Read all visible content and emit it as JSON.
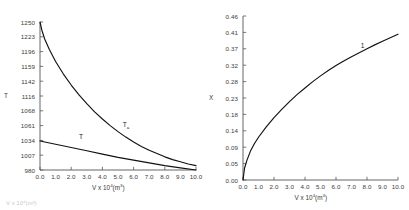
{
  "chart_data": [
    {
      "type": "line",
      "panel": "left",
      "title": "",
      "xlabel": "V x 10⁴(m³)",
      "ylabel": "T",
      "xlim": [
        0.0,
        10.0
      ],
      "ylim": [
        980,
        1250
      ],
      "grid": false,
      "legend": "inline-curve-labels",
      "xticks": [
        "0.0",
        "1.0",
        "2.0",
        "3.0",
        "4.0",
        "5.0",
        "6.0",
        "7.0",
        "8.0",
        "9.0",
        "10.0"
      ],
      "xtick_values": [
        0,
        1,
        2,
        3,
        4,
        5,
        6,
        7,
        8,
        9,
        10
      ],
      "yticks": [
        "980",
        "1007",
        "1034",
        "1061",
        "1068",
        "1116",
        "1142",
        "1159",
        "1196",
        "1223",
        "1250"
      ],
      "ytick_values": [
        980,
        1007,
        1034,
        1061,
        1088,
        1115,
        1142,
        1169,
        1196,
        1223,
        1250
      ],
      "series": [
        {
          "name": "T_a",
          "label_text": "T",
          "label_sub": "a",
          "label_x": 5.3,
          "label_y": 1062,
          "x": [
            0.0,
            0.12,
            0.3,
            0.6,
            1.0,
            1.5,
            2.0,
            2.5,
            3.0,
            3.5,
            4.0,
            4.5,
            5.0,
            5.5,
            6.0,
            6.5,
            7.0,
            7.5,
            8.0,
            8.5,
            9.0,
            9.5,
            10.0
          ],
          "values": [
            1250,
            1235,
            1219,
            1200,
            1178,
            1155,
            1135,
            1117,
            1101,
            1086,
            1073,
            1061,
            1050,
            1040,
            1031,
            1023,
            1016,
            1010,
            1004,
            999,
            995,
            991,
            988
          ]
        },
        {
          "name": "T",
          "label_text": "T",
          "label_sub": "",
          "label_x": 2.5,
          "label_y": 1040,
          "x": [
            0.0,
            1.0,
            2.0,
            3.0,
            4.0,
            5.0,
            6.0,
            7.0,
            8.0,
            9.0,
            10.0
          ],
          "values": [
            1033,
            1027,
            1021,
            1015,
            1009,
            1003,
            998,
            993,
            988,
            984,
            980
          ]
        }
      ]
    },
    {
      "type": "line",
      "panel": "right",
      "title": "",
      "xlabel": "V x 10⁴(m³)",
      "ylabel": "X",
      "xlim": [
        0.0,
        10.0
      ],
      "ylim": [
        0.0,
        0.46
      ],
      "grid": false,
      "legend": "inline-curve-labels",
      "xticks": [
        "0.0",
        "1.0",
        "2.0",
        "3.0",
        "4.0",
        "5.0",
        "6.0",
        "7.0",
        "8.0",
        "9.0",
        "10.0"
      ],
      "xtick_values": [
        0,
        1,
        2,
        3,
        4,
        5,
        6,
        7,
        8,
        9,
        10
      ],
      "yticks": [
        "0.00",
        "0.05",
        "0.09",
        "0.14",
        "0.18",
        "0.23",
        "0.28",
        "0.32",
        "0.37",
        "0.41",
        "0.46"
      ],
      "ytick_values": [
        0.0,
        0.046,
        0.092,
        0.138,
        0.184,
        0.23,
        0.276,
        0.322,
        0.368,
        0.414,
        0.46
      ],
      "series": [
        {
          "name": "1",
          "label_text": "1",
          "label_sub": "",
          "label_x": 7.6,
          "label_y": 0.375,
          "x": [
            0.0,
            0.1,
            0.25,
            0.5,
            0.75,
            1.0,
            1.5,
            2.0,
            2.5,
            3.0,
            3.5,
            4.0,
            4.5,
            5.0,
            5.5,
            6.0,
            6.5,
            7.0,
            7.5,
            8.0,
            8.5,
            9.0,
            9.5,
            10.0
          ],
          "values": [
            0.0,
            0.033,
            0.055,
            0.083,
            0.103,
            0.12,
            0.149,
            0.175,
            0.198,
            0.22,
            0.24,
            0.258,
            0.276,
            0.292,
            0.307,
            0.321,
            0.334,
            0.346,
            0.357,
            0.368,
            0.379,
            0.389,
            0.399,
            0.409
          ]
        }
      ]
    }
  ],
  "caption": {
    "partial_text": "V x 10⁴(m³)"
  }
}
